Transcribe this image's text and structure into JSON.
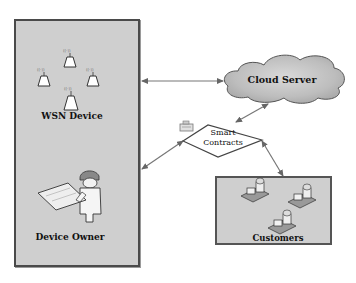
{
  "diagram": {
    "type": "system-architecture",
    "nodes": {
      "wsn_device": {
        "label": "WSN Device",
        "icon": "wireless-sensor-icon",
        "count": 4
      },
      "device_owner": {
        "label": "Device Owner",
        "icon": "engineer-with-blueprint-icon"
      },
      "cloud_server": {
        "label": "Cloud Server",
        "icon": "cloud-icon"
      },
      "smart_contracts": {
        "label_line1": "Smart",
        "label_line2": "Contracts",
        "icon": "contract-icon"
      },
      "customers": {
        "label": "Customers",
        "icon": "house-icon",
        "count": 3
      }
    },
    "edges": [
      {
        "from": "wsn_device",
        "to": "cloud_server",
        "direction": "bidirectional"
      },
      {
        "from": "device_owner",
        "to": "smart_contracts",
        "direction": "bidirectional"
      },
      {
        "from": "smart_contracts",
        "to": "cloud_server",
        "direction": "bidirectional"
      },
      {
        "from": "smart_contracts",
        "to": "customers",
        "direction": "bidirectional"
      }
    ],
    "colors": {
      "box_fill": "#cfcfcf",
      "box_border": "#4a4a4a",
      "cloud_fill": "#c4c4c4",
      "line": "#666666"
    }
  }
}
